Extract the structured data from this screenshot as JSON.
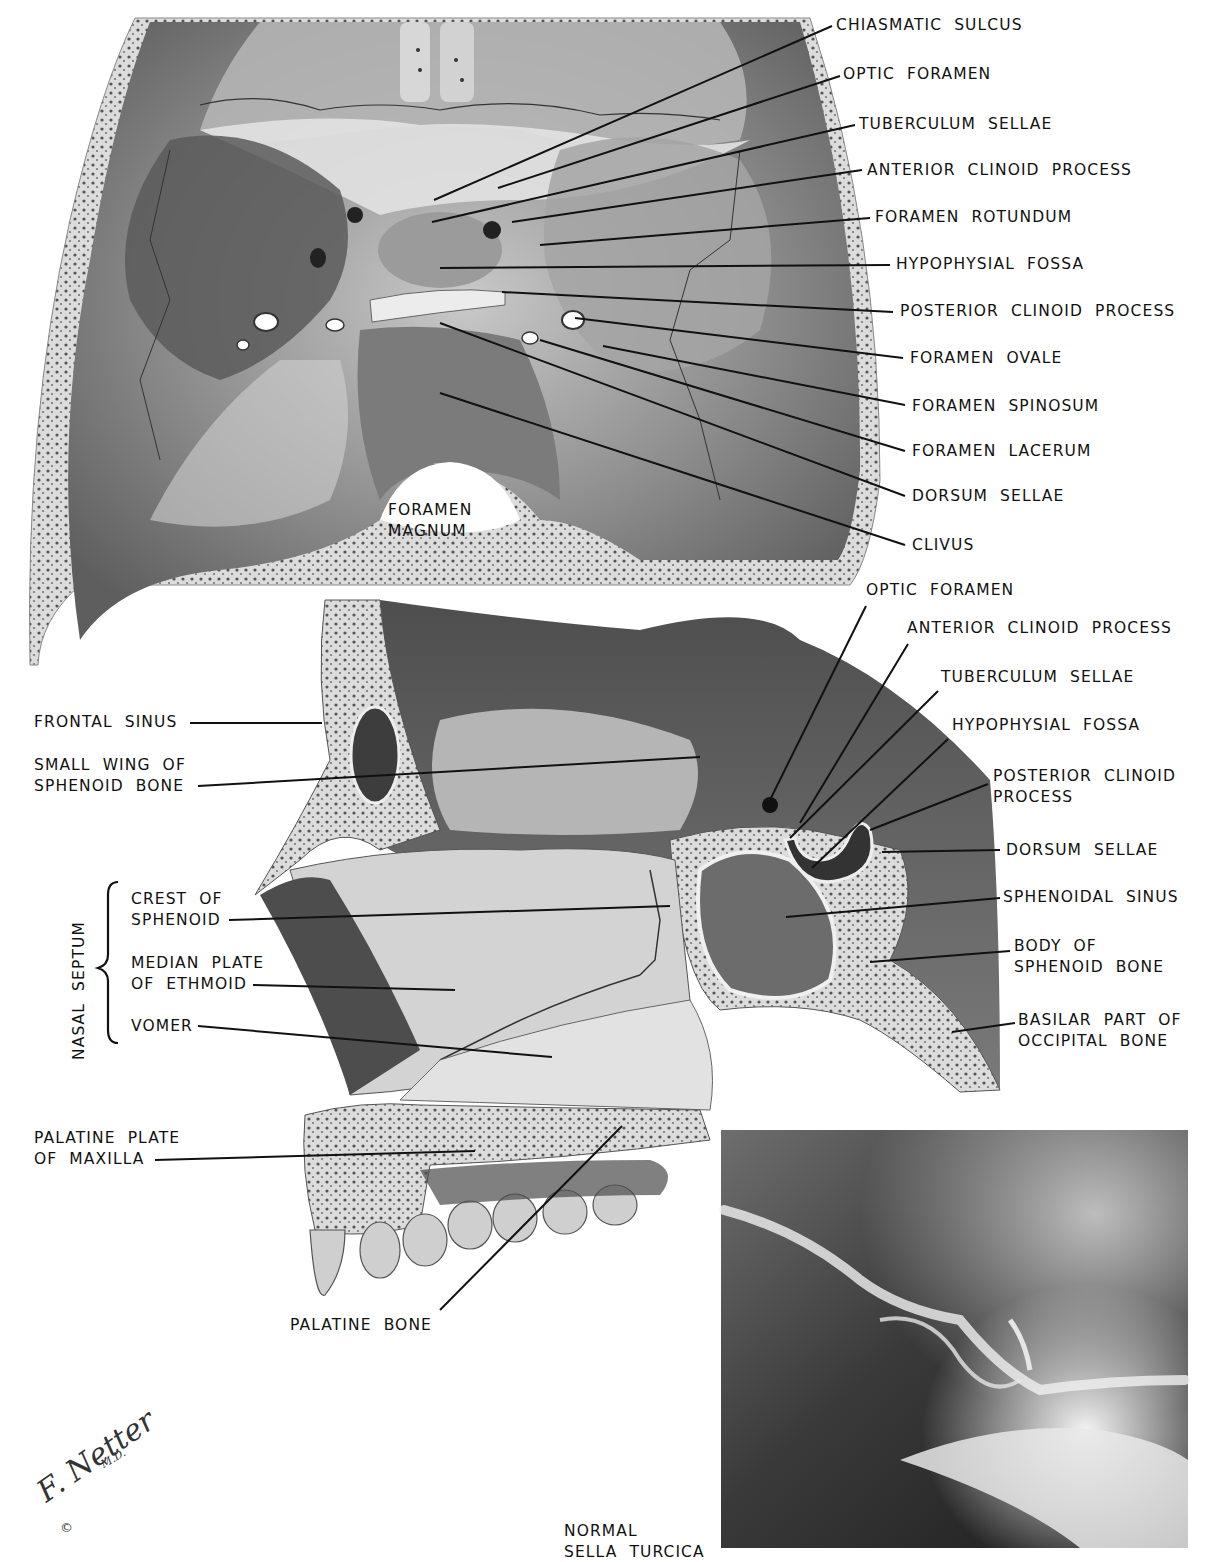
{
  "figure": {
    "artist_signature": "F. Netter",
    "artist_suffix": "M.D.",
    "copyright_symbol": "©"
  },
  "panels": {
    "cranial_base": {
      "description": "Superior view of cranial base (sella turcica region)",
      "inline_labels": [
        {
          "id": "foramen-magnum",
          "lines": [
            "FORAMEN",
            "MAGNUM"
          ],
          "x": 388,
          "y": 500
        }
      ],
      "labels": [
        {
          "id": "chiasmatic-sulcus",
          "lines": [
            "CHIASMATIC  SULCUS"
          ],
          "x": 836,
          "y": 15,
          "line": [
            434,
            200,
            832,
            26
          ]
        },
        {
          "id": "optic-foramen",
          "lines": [
            "OPTIC  FORAMEN"
          ],
          "x": 843,
          "y": 64,
          "line": [
            498,
            188,
            840,
            76
          ]
        },
        {
          "id": "tuberculum-sellae",
          "lines": [
            "TUBERCULUM  SELLAE"
          ],
          "x": 859,
          "y": 114,
          "line": [
            432,
            222,
            855,
            125
          ]
        },
        {
          "id": "anterior-clinoid-process",
          "lines": [
            "ANTERIOR  CLINOID  PROCESS"
          ],
          "x": 867,
          "y": 160,
          "line": [
            512,
            222,
            862,
            170
          ]
        },
        {
          "id": "foramen-rotundum",
          "lines": [
            "FORAMEN  ROTUNDUM"
          ],
          "x": 875,
          "y": 207,
          "line": [
            540,
            245,
            870,
            218
          ]
        },
        {
          "id": "hypophysial-fossa",
          "lines": [
            "HYPOPHYSIAL  FOSSA"
          ],
          "x": 896,
          "y": 254,
          "line": [
            440,
            268,
            890,
            265
          ]
        },
        {
          "id": "posterior-clinoid-process",
          "lines": [
            "POSTERIOR  CLINOID  PROCESS"
          ],
          "x": 900,
          "y": 301,
          "line": [
            502,
            292,
            893,
            312
          ]
        },
        {
          "id": "foramen-ovale",
          "lines": [
            "FORAMEN  OVALE"
          ],
          "x": 910,
          "y": 348,
          "line": [
            575,
            318,
            903,
            358
          ]
        },
        {
          "id": "foramen-spinosum",
          "lines": [
            "FORAMEN  SPINOSUM"
          ],
          "x": 912,
          "y": 396,
          "line": [
            603,
            346,
            905,
            405
          ]
        },
        {
          "id": "foramen-lacerum",
          "lines": [
            "FORAMEN  LACERUM"
          ],
          "x": 912,
          "y": 441,
          "line": [
            540,
            340,
            905,
            451
          ]
        },
        {
          "id": "dorsum-sellae",
          "lines": [
            "DORSUM  SELLAE"
          ],
          "x": 912,
          "y": 486,
          "line": [
            440,
            323,
            905,
            496
          ]
        },
        {
          "id": "clivus",
          "lines": [
            "CLIVUS"
          ],
          "x": 912,
          "y": 535,
          "line": [
            440,
            393,
            905,
            545
          ]
        }
      ]
    },
    "sagittal_section": {
      "description": "Median sagittal section of skull showing nasal septum and sphenoid",
      "group_label": "NASAL  SEPTUM",
      "labels_right": [
        {
          "id": "optic-foramen-2",
          "lines": [
            "OPTIC  FORAMEN"
          ],
          "x": 866,
          "y": 580,
          "line": [
            767,
            806,
            866,
            606
          ]
        },
        {
          "id": "anterior-clinoid-process-2",
          "lines": [
            "ANTERIOR  CLINOID  PROCESS"
          ],
          "x": 907,
          "y": 618,
          "line": [
            800,
            823,
            908,
            644
          ]
        },
        {
          "id": "tuberculum-sellae-2",
          "lines": [
            "TUBERCULUM  SELLAE"
          ],
          "x": 941,
          "y": 667,
          "line": [
            790,
            838,
            938,
            691
          ]
        },
        {
          "id": "hypophysial-fossa-2",
          "lines": [
            "HYPOPHYSIAL  FOSSA"
          ],
          "x": 952,
          "y": 715,
          "line": [
            812,
            868,
            948,
            739
          ]
        },
        {
          "id": "posterior-clinoid-process-2",
          "lines": [
            "POSTERIOR  CLINOID",
            "PROCESS"
          ],
          "x": 993,
          "y": 766,
          "line": [
            870,
            830,
            988,
            784
          ]
        },
        {
          "id": "dorsum-sellae-2",
          "lines": [
            "DORSUM  SELLAE"
          ],
          "x": 1006,
          "y": 840,
          "line": [
            882,
            852,
            1000,
            850
          ]
        },
        {
          "id": "sphenoidal-sinus",
          "lines": [
            "SPHENOIDAL  SINUS"
          ],
          "x": 1003,
          "y": 887,
          "line": [
            786,
            917,
            1000,
            898
          ]
        },
        {
          "id": "body-of-sphenoid-bone",
          "lines": [
            "BODY  OF",
            "SPHENOID  BONE"
          ],
          "x": 1014,
          "y": 936,
          "line": [
            870,
            962,
            1010,
            951
          ]
        },
        {
          "id": "basilar-part-of-occipital-bone",
          "lines": [
            "BASILAR  PART  OF",
            "OCCIPITAL  BONE"
          ],
          "x": 1018,
          "y": 1010,
          "line": [
            952,
            1032,
            1015,
            1023
          ]
        }
      ],
      "labels_left": [
        {
          "id": "frontal-sinus",
          "lines": [
            "FRONTAL  SINUS"
          ],
          "x": 34,
          "y": 712,
          "line": [
            190,
            723,
            322,
            723
          ]
        },
        {
          "id": "small-wing-of-sphenoid-bone",
          "lines": [
            "SMALL  WING  OF",
            "SPHENOID  BONE"
          ],
          "x": 34,
          "y": 755,
          "line": [
            198,
            786,
            700,
            757
          ]
        },
        {
          "id": "crest-of-sphenoid",
          "lines": [
            "CREST  OF",
            "SPHENOID"
          ],
          "x": 131,
          "y": 889,
          "line": [
            229,
            920,
            670,
            906
          ]
        },
        {
          "id": "median-plate-of-ethmoid",
          "lines": [
            "MEDIAN  PLATE",
            "OF  ETHMOID"
          ],
          "x": 131,
          "y": 953,
          "line": [
            253,
            985,
            455,
            990
          ]
        },
        {
          "id": "vomer",
          "lines": [
            "VOMER"
          ],
          "x": 131,
          "y": 1016,
          "line": [
            198,
            1026,
            552,
            1057
          ]
        },
        {
          "id": "palatine-plate-of-maxilla",
          "lines": [
            "PALATINE  PLATE",
            "OF  MAXILLA"
          ],
          "x": 34,
          "y": 1128,
          "line": [
            155,
            1160,
            475,
            1151
          ]
        },
        {
          "id": "palatine-bone",
          "lines": [
            "PALATINE  BONE"
          ],
          "x": 290,
          "y": 1315,
          "line": [
            440,
            1310,
            622,
            1126
          ]
        }
      ]
    },
    "radiograph": {
      "description": "Lateral radiograph of sella turcica",
      "caption_lines": [
        "NORMAL",
        "SELLA  TURCICA"
      ],
      "caption_x": 564,
      "caption_y": 1521,
      "box": [
        721,
        1130,
        1188,
        1548
      ]
    }
  }
}
